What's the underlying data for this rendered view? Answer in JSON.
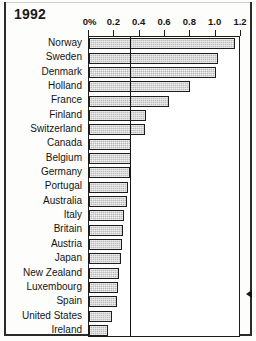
{
  "title": "1992",
  "annotation": {
    "oecd_label": "OECD average",
    "arrow_icon": "left-triangle-icon"
  },
  "axis": {
    "tick_labels": [
      "0%",
      "0.2",
      "0.4",
      "0.6",
      "0.8",
      "1.0",
      "1.2"
    ]
  },
  "chart_data": {
    "type": "bar",
    "orientation": "horizontal",
    "title": "1992",
    "xlabel": "",
    "ylabel": "",
    "xlim": [
      0,
      1.2
    ],
    "ticks": [
      0,
      0.2,
      0.4,
      0.6,
      0.8,
      1.0,
      1.2
    ],
    "tick_labels": [
      "0%",
      "0.2",
      "0.4",
      "0.6",
      "0.8",
      "1.0",
      "1.2"
    ],
    "grid": false,
    "legend": "none",
    "reference_line": {
      "label": "OECD average",
      "value": 0.33
    },
    "categories": [
      "Norway",
      "Sweden",
      "Denmark",
      "Holland",
      "France",
      "Finland",
      "Switzerland",
      "Canada",
      "Belgium",
      "Germany",
      "Portugal",
      "Australia",
      "Italy",
      "Britain",
      "Austria",
      "Japan",
      "New Zealand",
      "Luxembourg",
      "Spain",
      "United States",
      "Ireland"
    ],
    "values": [
      1.15,
      1.02,
      1.0,
      0.8,
      0.63,
      0.45,
      0.44,
      0.33,
      0.33,
      0.32,
      0.31,
      0.3,
      0.28,
      0.27,
      0.26,
      0.25,
      0.24,
      0.23,
      0.22,
      0.18,
      0.15
    ]
  }
}
